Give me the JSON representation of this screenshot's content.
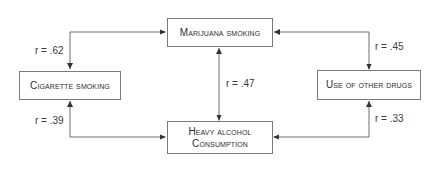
{
  "diagram": {
    "nodes": {
      "marijuana": {
        "label": "Marijuana smoking"
      },
      "cigarette": {
        "label": "Cigarette smoking"
      },
      "other_drugs": {
        "label": "Use of other drugs"
      },
      "alcohol": {
        "line1": "Heavy alcohol",
        "line2": "Consumption"
      }
    },
    "edges": {
      "cigarette_marijuana": {
        "label": "r = .62"
      },
      "marijuana_other_drugs": {
        "label": "r = .45"
      },
      "marijuana_alcohol": {
        "label": "r = .47"
      },
      "cigarette_alcohol": {
        "label": "r = .39"
      },
      "other_drugs_alcohol": {
        "label": "r = .33"
      }
    },
    "colors": {
      "line": "#6e6e6e",
      "border": "#7a7a7a",
      "text": "#2e2e2e"
    }
  }
}
